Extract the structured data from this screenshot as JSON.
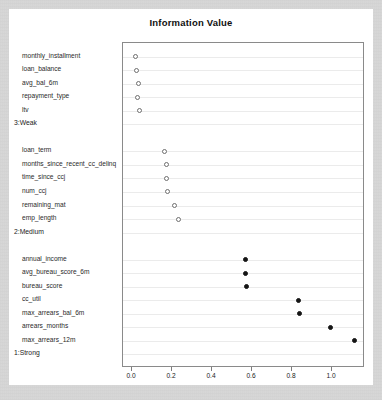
{
  "chart": {
    "title": "Information Value",
    "xlabel": "",
    "ylabel": ""
  },
  "axis": {
    "xticks": [
      "0.0",
      "0.2",
      "0.4",
      "0.6",
      "0.8",
      "1.0"
    ]
  },
  "chart_data": {
    "type": "scatter",
    "title": "Information Value",
    "xlabel": "",
    "ylabel": "",
    "xlim": [
      -0.045,
      1.165
    ],
    "ylim": [
      0,
      21
    ],
    "grid": true,
    "legend": false,
    "orientation": "horizontal-dot-plot",
    "xticks": [
      0.0,
      0.2,
      0.4,
      0.6,
      0.8,
      1.0
    ],
    "xticklabels": [
      "0.0",
      "0.2",
      "0.4",
      "0.6",
      "0.8",
      "1.0"
    ],
    "groups": [
      {
        "label": "1:Strong",
        "marker": "filled",
        "items": [
          {
            "label": "max_arrears_12m",
            "value": 1.11
          },
          {
            "label": "arrears_months",
            "value": 0.99
          },
          {
            "label": "max_arrears_bal_6m",
            "value": 0.835
          },
          {
            "label": "cc_util",
            "value": 0.83
          },
          {
            "label": "bureau_score",
            "value": 0.57
          },
          {
            "label": "avg_bureau_score_6m",
            "value": 0.565
          },
          {
            "label": "annual_income",
            "value": 0.565
          }
        ]
      },
      {
        "label": "2:Medium",
        "marker": "open",
        "items": [
          {
            "label": "emp_length",
            "value": 0.23
          },
          {
            "label": "remaining_mat",
            "value": 0.21
          },
          {
            "label": "num_ccj",
            "value": 0.175
          },
          {
            "label": "time_since_ccj",
            "value": 0.17
          },
          {
            "label": "months_since_recent_cc_delinq",
            "value": 0.17
          },
          {
            "label": "loan_term",
            "value": 0.16
          }
        ]
      },
      {
        "label": "3:Weak",
        "marker": "open",
        "items": [
          {
            "label": "ltv",
            "value": 0.035
          },
          {
            "label": "repayment_type",
            "value": 0.025
          },
          {
            "label": "avg_bal_6m",
            "value": 0.03
          },
          {
            "label": "loan_balance",
            "value": 0.02
          },
          {
            "label": "monthly_installment",
            "value": 0.015
          }
        ]
      }
    ]
  }
}
